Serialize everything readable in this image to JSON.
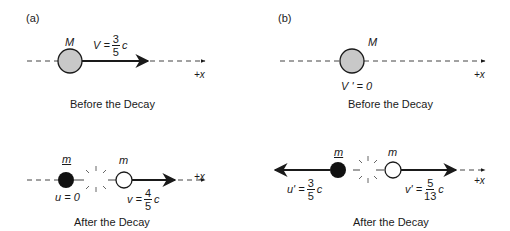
{
  "panels": [
    {
      "label": "(a)",
      "before": {
        "mass_label": "M",
        "velocity": {
          "symbol": "V =",
          "num": "3",
          "den": "5",
          "unit": "c"
        },
        "axis_label": "+x",
        "caption": "Before the Decay"
      },
      "after": {
        "left_mass_label": "m",
        "right_mass_label": "m",
        "left_velocity": {
          "text": "u = 0"
        },
        "right_velocity": {
          "symbol": "v =",
          "num": "4",
          "den": "5",
          "unit": "c"
        },
        "axis_label": "+x",
        "caption": "After the Decay"
      }
    },
    {
      "label": "(b)",
      "before": {
        "mass_label": "M",
        "velocity": {
          "text": "V ' = 0"
        },
        "axis_label": "+x",
        "caption": "Before the Decay"
      },
      "after": {
        "left_mass_label": "m",
        "right_mass_label": "m",
        "left_velocity": {
          "symbol": "u' =",
          "num": "3",
          "den": "5",
          "unit": "c"
        },
        "right_velocity": {
          "symbol": "v' =",
          "num": "5",
          "den": "13",
          "unit": "c"
        },
        "axis_label": "+x",
        "caption": "After the Decay"
      }
    }
  ],
  "colors": {
    "parent_fill": "#c8c8c8",
    "black_particle": "#111111",
    "white_particle": "#ffffff",
    "line": "#1a1a1a"
  }
}
